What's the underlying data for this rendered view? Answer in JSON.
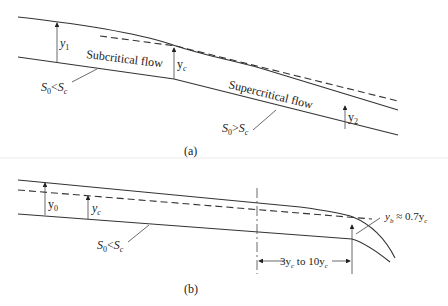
{
  "figure": {
    "panel_a": {
      "caption": "(a)",
      "depth_labels": {
        "y1": "y",
        "y1_sub": "1",
        "yc": "y",
        "yc_sub": "c",
        "y2": "y",
        "y2_sub": "2"
      },
      "region_labels": {
        "subcritical": "Subcritical flow",
        "supercritical": "Supercritical flow"
      },
      "slope_labels": {
        "mild": {
          "S": "S",
          "sub0": "0",
          "op": "<",
          "S2": "S",
          "subc": "c"
        },
        "steep": {
          "S": "S",
          "sub0": "0",
          "op": ">",
          "S2": "S",
          "subc": "c"
        }
      }
    },
    "panel_b": {
      "caption": "(b)",
      "depth_labels": {
        "y0": "y",
        "y0_sub": "0",
        "yc": "y",
        "yc_sub": "c"
      },
      "brink_label": {
        "y": "y",
        "sub": "b",
        "rest": " ≈ 0.7y",
        "sub2": "c"
      },
      "distance_label": {
        "a": "3y",
        "a_sub": "c",
        "mid": " to 10y",
        "b_sub": "c"
      },
      "slope_label": {
        "S": "S",
        "sub0": "0",
        "op": "<",
        "S2": "S",
        "subc": "c"
      }
    }
  }
}
